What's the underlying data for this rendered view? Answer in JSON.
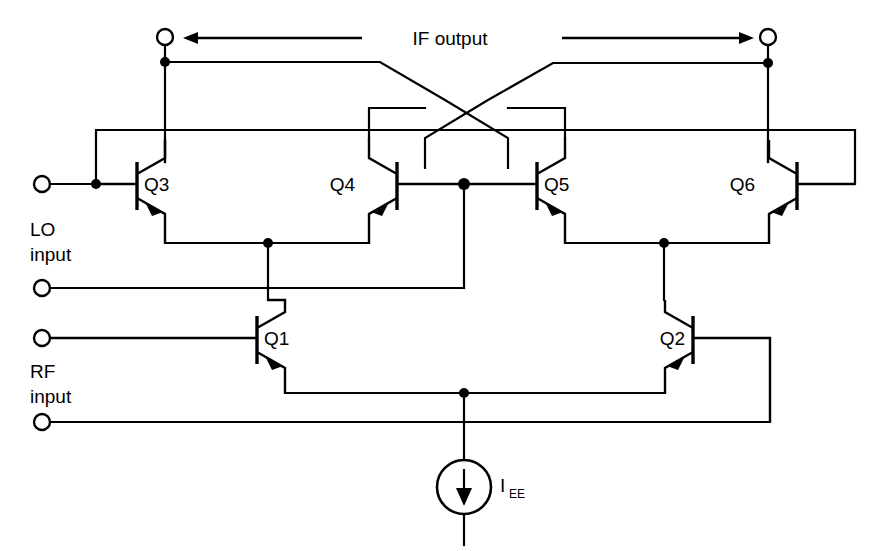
{
  "diagram": {
    "type": "circuit-schematic",
    "background_color": "#ffffff",
    "line_color": "#000000"
  },
  "labels": {
    "if_output": "IF output",
    "lo_input_line1": "LO",
    "lo_input_line2": "input",
    "rf_input_line1": "RF",
    "rf_input_line2": "input",
    "current_source_main": "I",
    "current_source_sub": "EE"
  },
  "transistors": [
    {
      "id": "Q1",
      "label": "Q1",
      "orientation": "right",
      "x": 268,
      "y": 338,
      "role": "rf-differential-pair-left"
    },
    {
      "id": "Q2",
      "label": "Q2",
      "orientation": "right",
      "x": 682,
      "y": 338,
      "role": "rf-differential-pair-right"
    },
    {
      "id": "Q3",
      "label": "Q3",
      "orientation": "right",
      "x": 148,
      "y": 184,
      "role": "lo-switching-quad"
    },
    {
      "id": "Q4",
      "label": "Q4",
      "orientation": "left",
      "x": 388,
      "y": 184,
      "role": "lo-switching-quad"
    },
    {
      "id": "Q5",
      "label": "Q5",
      "orientation": "right",
      "x": 548,
      "y": 184,
      "role": "lo-switching-quad"
    },
    {
      "id": "Q6",
      "label": "Q6",
      "orientation": "left",
      "x": 788,
      "y": 184,
      "role": "lo-switching-quad"
    }
  ],
  "terminals": [
    {
      "id": "if-out-left",
      "name": "IF output left terminal",
      "x": 165,
      "y": 37
    },
    {
      "id": "if-out-right",
      "name": "IF output right terminal",
      "x": 768,
      "y": 37
    },
    {
      "id": "lo-plus",
      "name": "LO input positive",
      "x": 42,
      "y": 184
    },
    {
      "id": "lo-minus",
      "name": "LO input negative",
      "x": 42,
      "y": 288
    },
    {
      "id": "rf-plus",
      "name": "RF input positive",
      "x": 42,
      "y": 338
    },
    {
      "id": "rf-minus",
      "name": "RF input negative",
      "x": 42,
      "y": 422
    }
  ],
  "arrows": [
    {
      "id": "if-arrow-left",
      "direction": "left",
      "x1": 362,
      "x2": 184,
      "y": 38
    },
    {
      "id": "if-arrow-right",
      "direction": "right",
      "x1": 562,
      "x2": 752,
      "y": 38
    }
  ],
  "current_source": {
    "id": "IEE",
    "x": 464,
    "y": 487,
    "radius": 27,
    "direction": "down"
  },
  "nodes": [
    {
      "id": "n-if-left",
      "x": 165,
      "y": 62
    },
    {
      "id": "n-if-right",
      "x": 768,
      "y": 63
    },
    {
      "id": "n-lo-plus",
      "x": 96,
      "y": 184
    },
    {
      "id": "n-q45-base",
      "x": 464,
      "y": 184
    },
    {
      "id": "n-q34-emit",
      "x": 268,
      "y": 243
    },
    {
      "id": "n-q56-emit",
      "x": 664,
      "y": 243
    },
    {
      "id": "n-tail",
      "x": 464,
      "y": 393
    }
  ]
}
